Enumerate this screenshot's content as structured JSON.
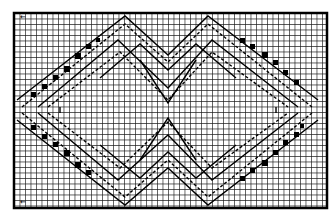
{
  "diagram": {
    "type": "charted grid pattern",
    "grid": {
      "columns": 57,
      "rows": 35,
      "cell_px": 5.5,
      "origin_px": [
        14,
        13
      ],
      "line_color": "#222222",
      "background": "#ffffff"
    },
    "motif": "double chevron / nested diamond stitch chart",
    "corner_marks": {
      "top_left": "←",
      "bottom_left": "←"
    }
  }
}
